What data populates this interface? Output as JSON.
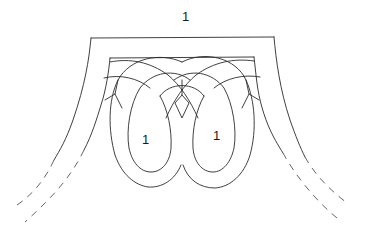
{
  "diagram": {
    "labels": {
      "top": "1",
      "left_loop": "1",
      "right_loop": "1"
    },
    "colors": {
      "stroke": "#2a2a2a",
      "dashed_stroke": "#555555",
      "background": "#ffffff"
    },
    "parts": [
      "outer-frame",
      "inner-frame",
      "interlaced-arches",
      "left-loop",
      "right-loop",
      "center-diamond",
      "left-dashed-continuation",
      "right-dashed-continuation"
    ]
  }
}
